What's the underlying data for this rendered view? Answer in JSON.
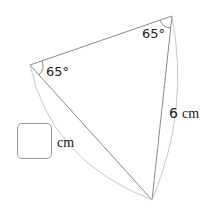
{
  "diagram": {
    "type": "isosceles-triangle",
    "angles": {
      "top_right": "65°",
      "left": "65°"
    },
    "sides": {
      "right_side_length": "6",
      "right_side_unit": "cm",
      "left_side_unit": "cm",
      "left_side_length": ""
    },
    "answer_box_value": "",
    "colors": {
      "stroke": "#8a8a8a",
      "arc": "#c8c8c8",
      "text": "#222222"
    }
  }
}
